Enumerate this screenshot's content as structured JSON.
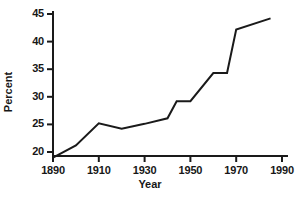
{
  "chart_data": {
    "type": "line",
    "title": "",
    "xlabel": "Year",
    "ylabel": "Percent",
    "xlim": [
      1890,
      1990
    ],
    "ylim": [
      18,
      46
    ],
    "grid": false,
    "legend": false,
    "xticks": [
      1890,
      1910,
      1930,
      1950,
      1970,
      1990
    ],
    "yticks": [
      20,
      25,
      30,
      35,
      40,
      45
    ],
    "xtick_labels": [
      "1890",
      "1910",
      "1930",
      "1950",
      "1970",
      "1990"
    ],
    "ytick_labels": [
      "20",
      "25",
      "30",
      "35",
      "40",
      "45"
    ],
    "series": [
      {
        "name": "Percent",
        "color": "#1a1a1a",
        "x": [
          1890,
          1900,
          1910,
          1920,
          1930,
          1940,
          1944,
          1950,
          1960,
          1966,
          1970,
          1985
        ],
        "values": [
          19.0,
          21.2,
          25.2,
          24.2,
          25.1,
          26.1,
          29.2,
          29.2,
          34.3,
          34.3,
          42.2,
          44.2
        ]
      }
    ]
  },
  "axes": {
    "y_axis_label": "Percent",
    "x_axis_label": "Year"
  },
  "caption": {
    "fragment": ""
  }
}
